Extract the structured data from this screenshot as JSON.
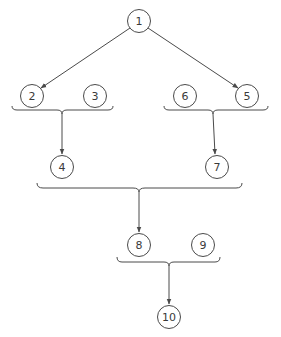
{
  "diagram": {
    "type": "dependency-tree",
    "colors": {
      "stroke": "#4a4a4a",
      "text": "#3a3a3a",
      "background": "#ffffff"
    },
    "nodes": [
      {
        "id": "1",
        "label": "1",
        "cx": 139,
        "cy": 21
      },
      {
        "id": "2",
        "label": "2",
        "cx": 32,
        "cy": 96
      },
      {
        "id": "3",
        "label": "3",
        "cx": 95,
        "cy": 96
      },
      {
        "id": "6",
        "label": "6",
        "cx": 185,
        "cy": 96
      },
      {
        "id": "5",
        "label": "5",
        "cx": 247,
        "cy": 96
      },
      {
        "id": "4",
        "label": "4",
        "cx": 62,
        "cy": 167
      },
      {
        "id": "7",
        "label": "7",
        "cx": 217,
        "cy": 167
      },
      {
        "id": "8",
        "label": "8",
        "cx": 139,
        "cy": 245
      },
      {
        "id": "9",
        "label": "9",
        "cx": 203,
        "cy": 245
      },
      {
        "id": "10",
        "label": "10",
        "cx": 169,
        "cy": 317
      }
    ],
    "edges": [
      {
        "from": "1",
        "to": "2"
      },
      {
        "from": "1",
        "to": "5"
      },
      {
        "from": "brace-2-3",
        "to": "4"
      },
      {
        "from": "brace-6-5",
        "to": "7"
      },
      {
        "from": "brace-4-7",
        "to": "8"
      },
      {
        "from": "brace-8-9",
        "to": "10"
      }
    ],
    "groups": [
      {
        "id": "brace-2-3",
        "members": [
          "2",
          "3"
        ]
      },
      {
        "id": "brace-6-5",
        "members": [
          "6",
          "5"
        ]
      },
      {
        "id": "brace-4-7",
        "members": [
          "4",
          "7"
        ]
      },
      {
        "id": "brace-8-9",
        "members": [
          "8",
          "9"
        ]
      }
    ]
  }
}
